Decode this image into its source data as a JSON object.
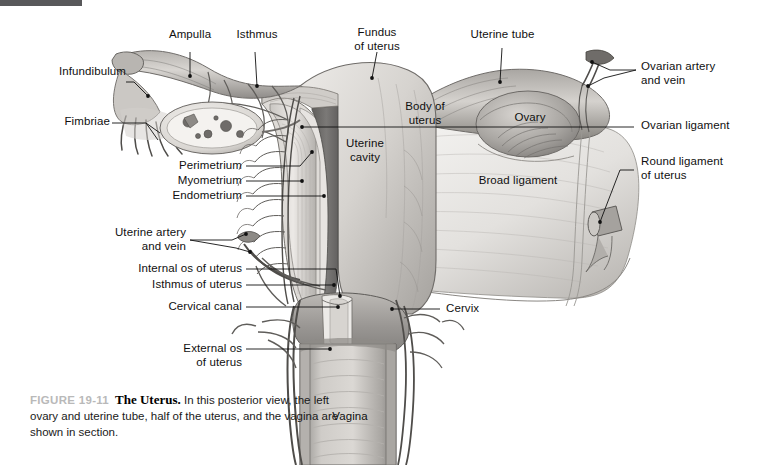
{
  "figure": {
    "number": "FIGURE 19-11",
    "title": "The Uterus.",
    "caption": " In this posterior view, the left ovary and uterine tube, half of the uterus, and the vagina are shown in section.",
    "marker_color": "#58585a"
  },
  "labels": {
    "ampulla": "Ampulla",
    "isthmus": "Isthmus",
    "fundus_of_uterus": "Fundus\nof uterus",
    "uterine_tube": "Uterine tube",
    "infundibulum": "Infundibulum",
    "fimbriae": "Fimbriae",
    "ovarian_artery_and_vein": "Ovarian artery\nand vein",
    "body_of_uterus": "Body of\nuterus",
    "ovary": "Ovary",
    "ovarian_ligament": "Ovarian ligament",
    "round_ligament_of_uterus": "Round ligament\nof uterus",
    "perimetrium": "Perimetrium",
    "myometrium": "Myometrium",
    "endometrium": "Endometrium",
    "uterine_cavity": "Uterine\ncavity",
    "broad_ligament": "Broad ligament",
    "uterine_artery_and_vein": "Uterine artery\nand vein",
    "internal_os_of_uterus": "Internal os of uterus",
    "isthmus_of_uterus": "Isthmus of uterus",
    "cervical_canal": "Cervical canal",
    "cervix": "Cervix",
    "external_os_of_uterus": "External os\nof uterus",
    "vagina": "Vagina"
  },
  "palette": {
    "leader_line": "#111111",
    "tissue_light": "#e9e7e4",
    "tissue_mid": "#c3c0bc",
    "tissue_dark": "#8e8b88",
    "cavity_dark": "#6e6c6a",
    "vessel": "#5a5856",
    "text": "#101010"
  }
}
